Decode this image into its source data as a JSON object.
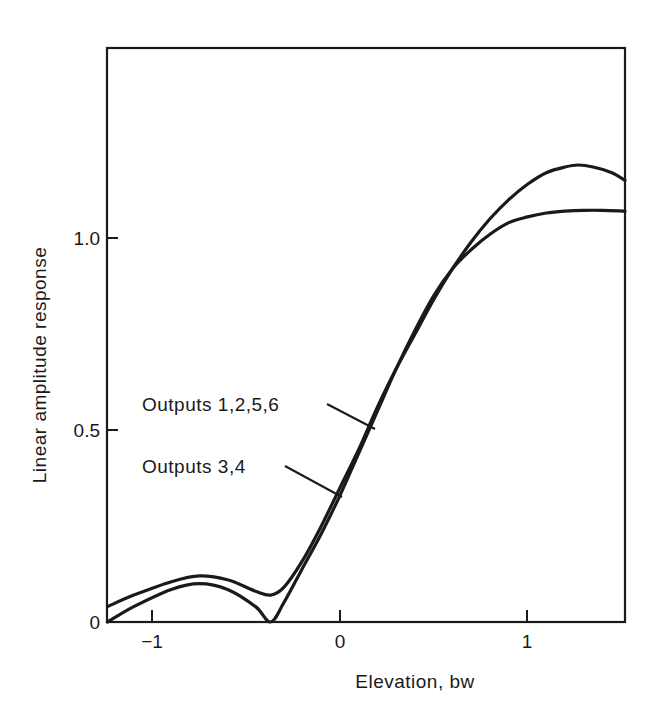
{
  "chart_data": {
    "type": "line",
    "title": "",
    "xlabel": "Elevation, bw",
    "ylabel": "Linear amplitude response",
    "xlim": [
      -1.24,
      1.52
    ],
    "ylim": [
      0,
      1.5
    ],
    "xticks": [
      -1,
      0,
      1
    ],
    "xtick_labels": [
      "−1",
      "0",
      "1"
    ],
    "yticks": [
      0,
      0.5,
      1.0
    ],
    "ytick_labels": [
      "0",
      "0.5",
      "1.0"
    ],
    "grid": false,
    "legend": "inline annotations with leader lines",
    "series": [
      {
        "name": "Outputs 1,2,5,6",
        "x": [
          -1.24,
          -1.1,
          -0.9,
          -0.75,
          -0.6,
          -0.45,
          -0.37,
          -0.3,
          -0.2,
          -0.1,
          0.0,
          0.1,
          0.2,
          0.3,
          0.4,
          0.5,
          0.6,
          0.7,
          0.8,
          0.9,
          1.0,
          1.1,
          1.2,
          1.27,
          1.35,
          1.45,
          1.52
        ],
        "y": [
          0.04,
          0.07,
          0.105,
          0.12,
          0.11,
          0.08,
          0.07,
          0.09,
          0.16,
          0.25,
          0.35,
          0.45,
          0.56,
          0.66,
          0.75,
          0.84,
          0.92,
          0.99,
          1.05,
          1.1,
          1.14,
          1.17,
          1.185,
          1.19,
          1.185,
          1.17,
          1.15
        ]
      },
      {
        "name": "Outputs 3,4",
        "x": [
          -1.24,
          -1.1,
          -0.9,
          -0.75,
          -0.6,
          -0.45,
          -0.37,
          -0.3,
          -0.2,
          -0.1,
          0.0,
          0.1,
          0.2,
          0.3,
          0.4,
          0.5,
          0.6,
          0.7,
          0.8,
          0.9,
          1.0,
          1.1,
          1.2,
          1.3,
          1.4,
          1.52
        ],
        "y": [
          0.0,
          0.04,
          0.085,
          0.1,
          0.085,
          0.04,
          0.0,
          0.05,
          0.14,
          0.23,
          0.33,
          0.44,
          0.55,
          0.66,
          0.76,
          0.85,
          0.92,
          0.97,
          1.01,
          1.04,
          1.055,
          1.065,
          1.07,
          1.072,
          1.072,
          1.07
        ]
      }
    ],
    "annotations": [
      {
        "text": "Outputs 1,2,5,6",
        "points_to_series": 0,
        "at_x": 0.19
      },
      {
        "text": "Outputs 3,4",
        "points_to_series": 1,
        "at_x": 0.01
      }
    ]
  },
  "axes": {
    "xlabel": "Elevation, bw",
    "ylabel": "Linear amplitude response",
    "xtick_labels": [
      "−1",
      "0",
      "1"
    ],
    "ytick_labels": [
      "0",
      "0.5",
      "1.0"
    ]
  },
  "annotations": {
    "label_1": "Outputs 1,2,5,6",
    "label_2": "Outputs 3,4"
  },
  "colors": {
    "ink": "#1a1a1a",
    "background": "#ffffff"
  }
}
